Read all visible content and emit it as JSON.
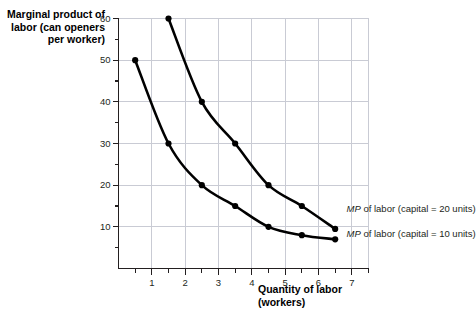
{
  "chart_data": {
    "type": "line",
    "title": "",
    "ylabel": "Marginal product of\nlabor (can openers\nper worker)",
    "xlabel": "Quantity of labor\n(workers)",
    "xlim": [
      0,
      7.5
    ],
    "ylim": [
      0,
      60
    ],
    "grid": true,
    "legend_position": "inline-right",
    "x_ticks": [
      1,
      2,
      3,
      4,
      5,
      6,
      7
    ],
    "x_tick_labels": [
      "1",
      "2",
      "3",
      "4",
      "5",
      "6",
      "7"
    ],
    "x_minor_ticks": [
      0.5,
      1.5,
      2.5,
      3.5,
      4.5,
      5.5,
      6.5,
      7.5
    ],
    "y_ticks": [
      10,
      20,
      30,
      40,
      50,
      60
    ],
    "y_tick_labels": [
      "10",
      "20",
      "30",
      "40",
      "50",
      "60"
    ],
    "y_minor_ticks": [
      5,
      15,
      25,
      35,
      45,
      55
    ],
    "series": [
      {
        "name": "MP of labor (capital = 10 units)",
        "label_prefix": "MP",
        "label_rest": " of labor (capital = 10 units)",
        "x": [
          0.5,
          1.5,
          2.5,
          3.5,
          4.5,
          5.5,
          6.5
        ],
        "values": [
          50,
          30,
          20,
          15,
          10,
          8,
          7
        ],
        "color": "#000000",
        "marker": "circle"
      },
      {
        "name": "MP of labor (capital = 20 units)",
        "label_prefix": "MP",
        "label_rest": " of labor (capital = 20 units)",
        "x": [
          1.5,
          2.5,
          3.5,
          4.5,
          5.5,
          6.5
        ],
        "values": [
          60,
          40,
          30,
          20,
          15,
          9.5
        ],
        "color": "#000000",
        "marker": "circle"
      }
    ],
    "annotations": [
      {
        "text": "MP of labor (capital = 20 units)",
        "x": 6.75,
        "y": 14
      },
      {
        "text": "MP of labor (capital = 10 units)",
        "x": 6.75,
        "y": 8
      }
    ],
    "colors": {
      "grid": "#c9cbd4",
      "axis": "#231f20",
      "curve": "#000000",
      "text": "#231f20"
    }
  }
}
